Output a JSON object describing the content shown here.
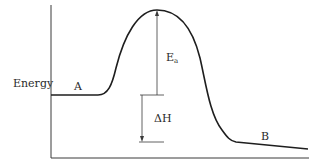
{
  "diagram": {
    "type": "energy-profile",
    "y_axis_label": "Energy",
    "reactant_label": "A",
    "product_label": "B",
    "activation_energy_label": {
      "main": "E",
      "subscript": "a"
    },
    "enthalpy_change_label": "ΔH",
    "colors": {
      "curve": "#1e1e1e",
      "axis": "#3a3a3a",
      "arrow": "#3a3a3a",
      "text": "#2a2a2a",
      "background": "#ffffff"
    }
  }
}
